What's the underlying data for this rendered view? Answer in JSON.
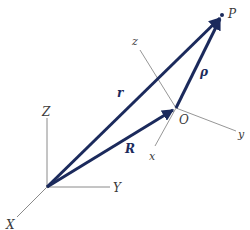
{
  "diagram": {
    "title": "",
    "colors": {
      "vector": "#1b2a5c",
      "axis": "#8a8a8a",
      "label": "#3a3a3a",
      "background": "#ffffff"
    },
    "fixed_frame": {
      "origin": [
        47,
        187
      ],
      "axes": [
        {
          "name": "Z",
          "label": "Z",
          "end": [
            47,
            118
          ],
          "label_pos": [
            42,
            116
          ]
        },
        {
          "name": "Y",
          "label": "Y",
          "end": [
            110,
            187
          ],
          "label_pos": [
            113,
            192
          ]
        },
        {
          "name": "X",
          "label": "X",
          "end": [
            17,
            217
          ],
          "label_pos": [
            6,
            229
          ]
        }
      ]
    },
    "moving_frame": {
      "origin_label": "O",
      "origin": [
        176,
        108
      ],
      "origin_label_pos": [
        179,
        124
      ],
      "axes": [
        {
          "name": "z",
          "label": "z",
          "end": [
            140,
            50
          ],
          "label_pos": [
            132,
            45
          ]
        },
        {
          "name": "y",
          "label": "y",
          "end": [
            236,
            131
          ],
          "label_pos": [
            238,
            138
          ]
        },
        {
          "name": "x",
          "label": "x",
          "end": [
            155,
            146
          ],
          "label_pos": [
            149,
            160
          ]
        }
      ]
    },
    "point": {
      "label": "P",
      "pos": [
        222,
        15
      ],
      "label_pos": [
        228,
        15
      ]
    },
    "vectors": [
      {
        "name": "r",
        "label": "r",
        "from": [
          47,
          187
        ],
        "to": [
          222,
          15
        ],
        "label_pos": [
          117,
          97
        ]
      },
      {
        "name": "R",
        "label": "R",
        "from": [
          47,
          187
        ],
        "to": [
          176,
          108
        ],
        "label_pos": [
          125,
          153
        ]
      },
      {
        "name": "rho",
        "label": "ρ",
        "from": [
          176,
          108
        ],
        "to": [
          222,
          15
        ],
        "label_pos": [
          200,
          76
        ]
      }
    ]
  }
}
